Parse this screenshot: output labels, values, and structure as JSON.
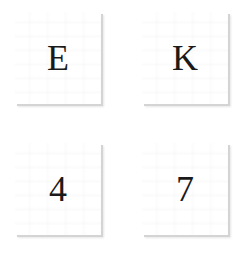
{
  "tiles": [
    {
      "label": "E"
    },
    {
      "label": "K"
    },
    {
      "label": "4"
    },
    {
      "label": "7"
    }
  ],
  "colors": {
    "background": "#ffffff",
    "tile": "#ffffff",
    "shadow": "#d4d4d4",
    "glyph": "#1a1a1a"
  }
}
